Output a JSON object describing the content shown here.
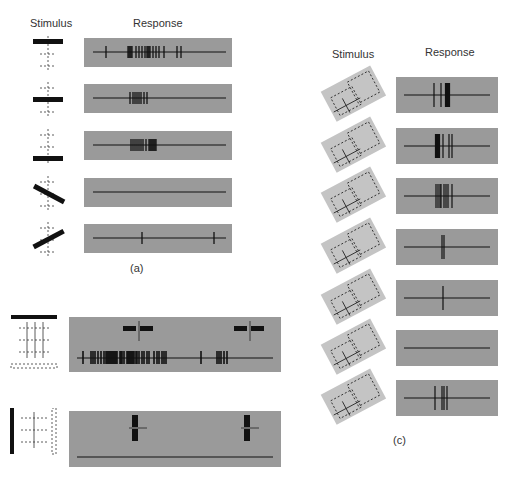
{
  "figure_a": {
    "header_stimulus": "Stimulus",
    "header_response": "Response",
    "caption": "(a)",
    "rows": [
      {
        "stimulus": "horizontal-bar-top",
        "spikes": [
          22,
          44,
          45,
          46,
          47,
          48,
          52,
          55,
          58,
          61,
          63,
          64,
          65,
          66,
          69,
          72,
          75,
          80,
          93,
          97
        ]
      },
      {
        "stimulus": "horizontal-bar-middle",
        "spikes": [
          46,
          49,
          51,
          53,
          55,
          57,
          60,
          63
        ]
      },
      {
        "stimulus": "horizontal-bar-bottom",
        "spikes": [
          47,
          49,
          51,
          53,
          55,
          57,
          59,
          62,
          65,
          66,
          67,
          68,
          69,
          70,
          71,
          72
        ]
      },
      {
        "stimulus": "oblique-bar-down",
        "spikes": []
      },
      {
        "stimulus": "oblique-bar-up",
        "spikes": [
          58,
          130
        ]
      }
    ]
  },
  "figure_b": {
    "rows": [
      {
        "stimulus": "horizontal-bar-moving-down",
        "markers": [
          70,
          181
        ]
      },
      {
        "stimulus": "vertical-bar-moving-right",
        "markers": [
          66,
          178
        ]
      }
    ]
  },
  "figure_c": {
    "header_stimulus": "Stimulus",
    "header_response": "Response",
    "caption": "(c)",
    "rows": [
      {
        "stimulus": "corner-wedge-1",
        "spikes": [
          38,
          45,
          50,
          51,
          52,
          53
        ]
      },
      {
        "stimulus": "corner-wedge-2",
        "spikes": [
          40,
          41,
          42,
          43,
          47,
          53,
          56
        ]
      },
      {
        "stimulus": "corner-wedge-3",
        "spikes": [
          40,
          42,
          44,
          45,
          48,
          50,
          52,
          56
        ]
      },
      {
        "stimulus": "corner-wedge-4",
        "spikes": [
          46,
          48
        ]
      },
      {
        "stimulus": "corner-wedge-5",
        "spikes": [
          47
        ]
      },
      {
        "stimulus": "corner-wedge-6",
        "spikes": []
      },
      {
        "stimulus": "corner-wedge-7",
        "spikes": [
          39,
          46,
          48,
          51
        ]
      }
    ]
  }
}
